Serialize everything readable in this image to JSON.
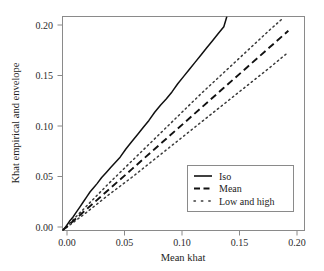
{
  "chart_data": {
    "type": "line",
    "title": "",
    "xlabel": "Mean khat",
    "ylabel": "Khat empirical and envelope",
    "xlim": [
      0.0,
      0.21
    ],
    "ylim": [
      0.0,
      0.21
    ],
    "xticks": [
      0.0,
      0.05,
      0.1,
      0.15,
      0.2
    ],
    "yticks": [
      0.0,
      0.05,
      0.1,
      0.15,
      0.2
    ],
    "xtick_labels": [
      "0.00",
      "0.05",
      "0.10",
      "0.15",
      "0.20"
    ],
    "ytick_labels": [
      "0.00",
      "0.05",
      "0.10",
      "0.15",
      "0.20"
    ],
    "grid": false,
    "legend_position": "lower right",
    "series": [
      {
        "name": "Iso",
        "style": "solid",
        "color": "#111111",
        "x": [
          0.0,
          0.003,
          0.006,
          0.009,
          0.012,
          0.015,
          0.018,
          0.021,
          0.024,
          0.027,
          0.03,
          0.034,
          0.038,
          0.042,
          0.046,
          0.05,
          0.055,
          0.06,
          0.065,
          0.07,
          0.075,
          0.08,
          0.085,
          0.09,
          0.095,
          0.1,
          0.105,
          0.11,
          0.115,
          0.12,
          0.125,
          0.13,
          0.135,
          0.14,
          0.1425
        ],
        "y": [
          0.0,
          0.004,
          0.009,
          0.013,
          0.018,
          0.023,
          0.028,
          0.033,
          0.038,
          0.042,
          0.046,
          0.052,
          0.057,
          0.062,
          0.067,
          0.072,
          0.08,
          0.087,
          0.094,
          0.101,
          0.108,
          0.116,
          0.123,
          0.129,
          0.136,
          0.144,
          0.151,
          0.158,
          0.165,
          0.172,
          0.179,
          0.186,
          0.193,
          0.2,
          0.2095
        ]
      },
      {
        "name": "Mean",
        "style": "dashed",
        "color": "#111111",
        "x": [
          0.0,
          0.02,
          0.04,
          0.06,
          0.08,
          0.1,
          0.12,
          0.14,
          0.16,
          0.18,
          0.196
        ],
        "y": [
          0.0,
          0.02,
          0.04,
          0.06,
          0.08,
          0.1,
          0.12,
          0.14,
          0.16,
          0.18,
          0.196
        ]
      },
      {
        "name": "High",
        "style": "dotted",
        "color": "#3a3a3a",
        "x": [
          0.0,
          0.02,
          0.04,
          0.06,
          0.08,
          0.1,
          0.12,
          0.14,
          0.16,
          0.18,
          0.191
        ],
        "y": [
          0.0,
          0.023,
          0.046,
          0.068,
          0.09,
          0.112,
          0.134,
          0.155,
          0.176,
          0.197,
          0.208
        ]
      },
      {
        "name": "Low",
        "style": "dotted",
        "color": "#3a3a3a",
        "x": [
          0.0,
          0.02,
          0.04,
          0.06,
          0.08,
          0.1,
          0.12,
          0.14,
          0.16,
          0.18,
          0.196
        ],
        "y": [
          0.0,
          0.017,
          0.035,
          0.052,
          0.07,
          0.088,
          0.106,
          0.124,
          0.142,
          0.16,
          0.175
        ]
      }
    ],
    "legend": [
      {
        "label": "Iso",
        "style": "solid"
      },
      {
        "label": "Mean",
        "style": "dashed"
      },
      {
        "label": "Low and high",
        "style": "dotted"
      }
    ]
  }
}
